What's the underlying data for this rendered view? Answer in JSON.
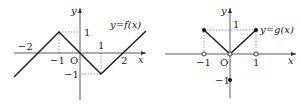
{
  "figures": [
    {
      "id": "f",
      "curve_label": "y=f(x)",
      "x_axis_label": "x",
      "y_axis_label": "y",
      "origin_label": "O",
      "tick_labels": {
        "x_neg2": "−2",
        "x_neg1": "−1",
        "x_1": "1",
        "x_2": "2",
        "y_1": "1",
        "y_neg1": "−1"
      },
      "x_range": [
        -3,
        3
      ],
      "y_range": [
        -1.5,
        1.5
      ],
      "polyline": [
        [
          -3,
          -2
        ],
        [
          -1,
          1
        ],
        [
          1,
          -1
        ],
        [
          3,
          1.7
        ]
      ],
      "zeros": [
        -2,
        0,
        2
      ],
      "dashed_guides": [
        [
          [
            -1,
            0
          ],
          [
            -1,
            1
          ]
        ],
        [
          [
            -1,
            1
          ],
          [
            0,
            1
          ]
        ],
        [
          [
            1,
            0
          ],
          [
            1,
            -1
          ]
        ],
        [
          [
            1,
            -1
          ],
          [
            0,
            -1
          ]
        ]
      ]
    },
    {
      "id": "g",
      "curve_label": "y=g(x)",
      "x_axis_label": "x",
      "y_axis_label": "y",
      "origin_label": "O",
      "tick_labels": {
        "x_neg1": "−1",
        "x_1": "1",
        "y_1": "1",
        "y_neg1": "−1"
      },
      "segments": [
        [
          [
            -1,
            1
          ],
          [
            0,
            0
          ]
        ],
        [
          [
            0,
            0
          ],
          [
            1,
            1
          ]
        ]
      ],
      "filled_points": [
        [
          -1,
          1
        ],
        [
          1,
          1
        ],
        [
          0,
          -1
        ]
      ],
      "open_points": [
        [
          -1,
          0
        ],
        [
          0,
          0
        ],
        [
          1,
          0
        ]
      ],
      "dashed_guides": [
        [
          [
            -1,
            0
          ],
          [
            -1,
            1
          ]
        ],
        [
          [
            -1,
            1
          ],
          [
            1,
            1
          ]
        ],
        [
          [
            1,
            0
          ],
          [
            1,
            1
          ]
        ]
      ]
    }
  ]
}
